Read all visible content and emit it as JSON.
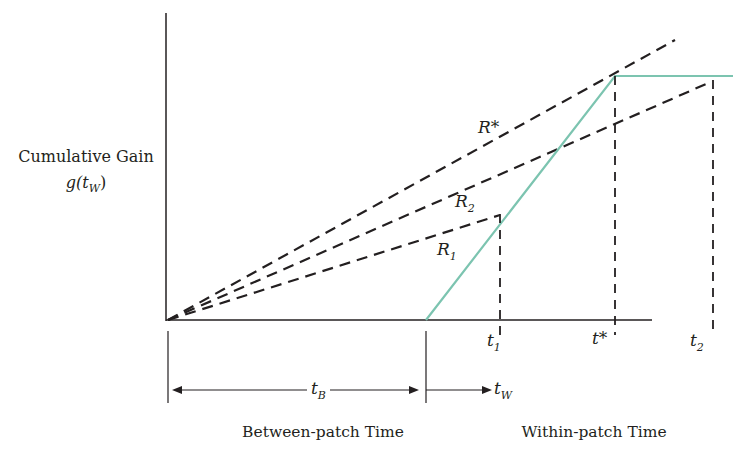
{
  "diagram": {
    "type": "marginal-value-theorem",
    "y_axis_label": "Cumulative Gain",
    "y_axis_function": {
      "base": "g(t",
      "sub": "W",
      "close": ")"
    },
    "x_sections": {
      "between_label": "Between-patch Time",
      "within_label": "Within-patch Time",
      "between_arrow": {
        "symbol": "t",
        "sub": "B"
      },
      "within_arrow": {
        "symbol": "t",
        "sub": "W"
      }
    },
    "rate_lines": [
      {
        "name": "R*",
        "symbol": "R*",
        "sub": ""
      },
      {
        "name": "R2",
        "symbol": "R",
        "sub": "2"
      },
      {
        "name": "R1",
        "symbol": "R",
        "sub": "1"
      }
    ],
    "time_marks": [
      {
        "name": "t1",
        "symbol": "t",
        "sub": "1"
      },
      {
        "name": "t*",
        "symbol": "t*",
        "sub": ""
      },
      {
        "name": "t2",
        "symbol": "t",
        "sub": "2"
      }
    ],
    "colors": {
      "gain_curve": "#7cc4b0",
      "lines": "#231f20"
    }
  }
}
